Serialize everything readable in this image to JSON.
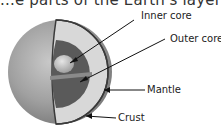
{
  "diagram": {
    "title_cut": "...e parts of the Earth's layers...",
    "labels": [
      {
        "id": "inner-core",
        "text": "Inner core"
      },
      {
        "id": "outer-core",
        "text": "Outer core"
      },
      {
        "id": "mantle",
        "text": "Mantle"
      },
      {
        "id": "crust",
        "text": "Crust"
      }
    ],
    "colors": {
      "sphere_outer": "#9a9a9a",
      "mantle": "#d6d6d6",
      "outer_core": "#555555",
      "inner_core": "#bdbdbd",
      "crust_line": "#3a3a3a",
      "pointer": "#111111"
    }
  }
}
